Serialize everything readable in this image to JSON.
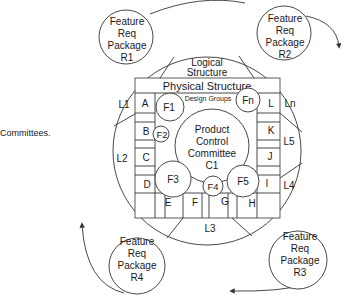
{
  "caption": "Committees.",
  "logical_structure": {
    "line1": "Logical",
    "line2": "Structure"
  },
  "physical_structure": {
    "title": "Physical Structure",
    "subtitle": "Design Groups"
  },
  "product_control": {
    "line1": "Product",
    "line2": "Control",
    "line3": "Committee",
    "line4": "C1"
  },
  "feature_circles": {
    "f1": "F1",
    "f2": "F2",
    "f3": "F3",
    "f4": "F4",
    "f5": "F5",
    "fn": "Fn"
  },
  "left_cells": {
    "a": "A",
    "b": "B",
    "c": "C",
    "d": "D"
  },
  "right_cells": {
    "l": "L",
    "k": "K",
    "j": "J",
    "i": "I"
  },
  "bottom_cells": {
    "e": "E",
    "f": "F",
    "g": "G",
    "h": "H"
  },
  "layers": {
    "l1": "L1",
    "l2": "L2",
    "l3": "L3",
    "l4": "L4",
    "l5": "L5",
    "ln": "Ln"
  },
  "packages": {
    "r1": {
      "l1": "Feature",
      "l2": "Req",
      "l3": "Package",
      "l4": "R1"
    },
    "r2": {
      "l1": "Feature",
      "l2": "Req",
      "l3": "Package",
      "l4": "R2"
    },
    "r3": {
      "l1": "Feature",
      "l2": "Req",
      "l3": "Package",
      "l4": "R3"
    },
    "r4": {
      "l1": "Feature",
      "l2": "Req",
      "l3": "Package",
      "l4": "R4"
    }
  }
}
